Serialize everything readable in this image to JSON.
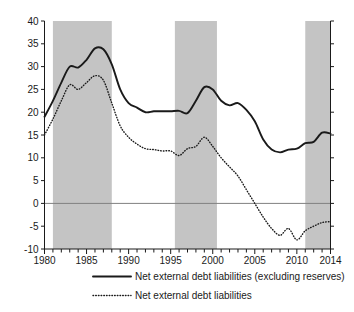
{
  "chart_data": {
    "type": "line",
    "title": "",
    "subtitle": "",
    "xlabel": "",
    "ylabel": "",
    "xlim": [
      1980,
      2014
    ],
    "ylim": [
      -10,
      40
    ],
    "grid": false,
    "zero_line": true,
    "legend_position": "bottom",
    "x_ticks": [
      1980,
      1985,
      1990,
      1995,
      2000,
      2005,
      2010,
      2014
    ],
    "x_tick_labels": [
      "1980",
      "1985",
      "1990",
      "1995",
      "2000",
      "2005",
      "2010",
      "2014"
    ],
    "x_minor_step": 1,
    "y_ticks": [
      -10,
      -5,
      0,
      5,
      10,
      15,
      20,
      25,
      30,
      35,
      40
    ],
    "y_tick_labels": [
      "-10",
      "-5",
      "0",
      "5",
      "10",
      "15",
      "20",
      "25",
      "30",
      "35",
      "40"
    ],
    "x": [
      1980,
      1981,
      1982,
      1983,
      1984,
      1985,
      1986,
      1987,
      1988,
      1989,
      1990,
      1991,
      1992,
      1993,
      1994,
      1995,
      1996,
      1997,
      1998,
      1999,
      2000,
      2001,
      2002,
      2003,
      2004,
      2005,
      2006,
      2007,
      2008,
      2009,
      2010,
      2011,
      2012,
      2013,
      2014
    ],
    "series": [
      {
        "name": "Net external debt liabilities (excluding reserves)",
        "style": "solid",
        "color": "#1a1a1a",
        "values": [
          19.0,
          22.5,
          26.5,
          30.0,
          29.8,
          31.5,
          34.0,
          33.8,
          30.5,
          25.0,
          22.0,
          21.0,
          20.0,
          20.2,
          20.2,
          20.2,
          20.3,
          19.8,
          22.5,
          25.5,
          25.0,
          22.5,
          21.5,
          22.0,
          20.5,
          18.0,
          14.0,
          11.8,
          11.2,
          11.8,
          12.0,
          13.2,
          13.5,
          15.5,
          15.3
        ]
      },
      {
        "name": "Net external debt liabilities",
        "style": "dotted",
        "color": "#1a1a1a",
        "values": [
          15.0,
          18.5,
          22.5,
          26.0,
          25.0,
          26.5,
          28.0,
          27.0,
          22.0,
          17.0,
          14.5,
          13.0,
          12.0,
          11.8,
          11.5,
          11.5,
          10.5,
          12.0,
          12.5,
          14.5,
          12.5,
          10.0,
          8.0,
          6.0,
          3.0,
          0.0,
          -3.0,
          -5.5,
          -7.0,
          -5.5,
          -8.0,
          -6.0,
          -5.0,
          -4.2,
          -4.0
        ]
      }
    ],
    "shaded_bands": [
      {
        "start": 1981.0,
        "end": 1988.0
      },
      {
        "start": 1995.5,
        "end": 2000.5
      },
      {
        "start": 2011.0,
        "end": 2014.0
      }
    ],
    "shaded_band_color": "#c4c4c4"
  },
  "legend": {
    "items": [
      {
        "label": "Net external debt liabilities (excluding reserves)",
        "style": "solid"
      },
      {
        "label": "Net external debt liabilities",
        "style": "dotted"
      }
    ]
  },
  "colors": {
    "axis": "#1a1a1a",
    "zero_line": "#808080",
    "band": "#c4c4c4",
    "background": "#ffffff"
  }
}
